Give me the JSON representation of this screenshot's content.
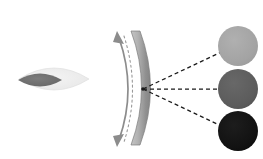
{
  "figure": {
    "canvas": {
      "width": 263,
      "height": 159,
      "background": "#ffffff"
    }
  },
  "colors": {
    "background": "#ffffff",
    "mirror_band_light": "#b9b9b9",
    "mirror_band_dark": "#8e8e8e",
    "mirror_band_edge": "#7d7d7d",
    "rotation_arrow": "#8c8c8c",
    "dotted_arc": "#9a9a9a",
    "ray_line": "#1a1a1a",
    "lens_outer": "#ececec",
    "lens_outer_edge": "#dcdcdc",
    "lens_inner": "#6e6e6e",
    "spot_light": "#a3a3a3",
    "spot_medium": "#5c5c5c",
    "spot_dark": "#111111"
  },
  "source_object": {
    "name": "beam-source-lens",
    "outer_lens": {
      "label": "outer lens envelope",
      "center_x": 54,
      "center_y": 79,
      "half_width": 35,
      "half_height": 22,
      "fill": "#ececec"
    },
    "inner_lens": {
      "label": "inner lens core",
      "center_x": 40,
      "center_y": 80,
      "half_width": 22,
      "half_height": 13,
      "fill": "#6e6e6e"
    }
  },
  "mirror": {
    "name": "concave-scanning-mirror",
    "label": "curved reflector band",
    "top_x": 131,
    "top_y": 31,
    "bottom_x": 131,
    "bottom_y": 145,
    "bulge_x": 152,
    "thickness": 9,
    "fill_light": "#b9b9b9",
    "fill_dark": "#8e8e8e"
  },
  "rotation_arrow": {
    "name": "mirror-rotation-arrow",
    "label": "double-headed rotation arrow",
    "top_x": 119,
    "top_y": 32,
    "bottom_x": 119,
    "bottom_y": 145,
    "bulge_x": 136,
    "color": "#8c8c8c",
    "heads": 2
  },
  "dotted_arc": {
    "name": "mirror-travel-dotted-arc",
    "label": "dotted arc showing mirror sweep",
    "color": "#9a9a9a",
    "dash": "2 3"
  },
  "focal_point": {
    "name": "ray-convergence-point",
    "label": "focal / pivot point on mirror surface",
    "x": 143,
    "y": 89
  },
  "rays": [
    {
      "name": "ray-upper",
      "label": "upper deflected ray",
      "to_x": 234,
      "to_y": 46,
      "dash": "4 3"
    },
    {
      "name": "ray-middle",
      "label": "middle undeflected ray",
      "to_x": 233,
      "to_y": 89,
      "dash": "4 3"
    },
    {
      "name": "ray-lower",
      "label": "lower deflected ray",
      "to_x": 232,
      "to_y": 131,
      "dash": "4 3"
    }
  ],
  "spots": [
    {
      "name": "spot-upper",
      "label": "upper target spot",
      "cx": 238,
      "cy": 46,
      "r": 20,
      "fill": "#a3a3a3",
      "intensity": "light"
    },
    {
      "name": "spot-middle",
      "label": "middle target spot",
      "cx": 238,
      "cy": 89,
      "r": 20,
      "fill": "#5c5c5c",
      "intensity": "medium"
    },
    {
      "name": "spot-lower",
      "label": "lower target spot",
      "cx": 238,
      "cy": 131,
      "r": 20,
      "fill": "#111111",
      "intensity": "dark"
    }
  ]
}
